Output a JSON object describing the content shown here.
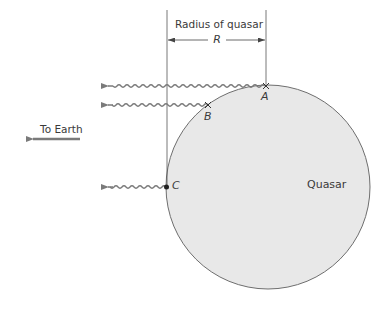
{
  "diagram": {
    "dimension": {
      "title": "Radius of quasar",
      "symbol": "R"
    },
    "points": [
      {
        "id": "A",
        "label": "A",
        "marker": "x"
      },
      {
        "id": "B",
        "label": "B",
        "marker": "x"
      },
      {
        "id": "C",
        "label": "C",
        "marker": "dot"
      }
    ],
    "direction_label": "To Earth",
    "object_label": "Quasar",
    "colors": {
      "quasar_fill": "#e8e8e8",
      "outline": "#6e6e6e",
      "wave": "#7a7a7a",
      "text": "#3a3a3a"
    }
  }
}
